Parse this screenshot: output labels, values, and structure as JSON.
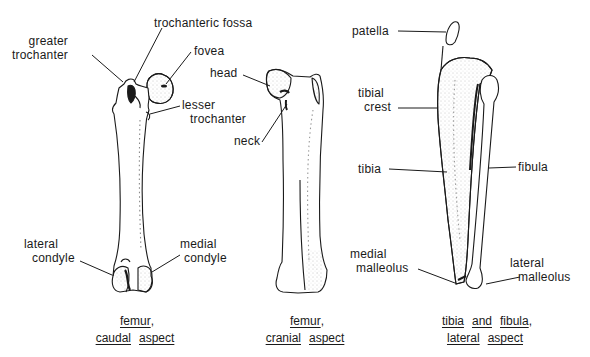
{
  "figure": {
    "colors": {
      "ink": "#1a1a1a",
      "background": "#ffffff",
      "stipple": "#9a9a9a"
    },
    "panels": [
      {
        "id": "femur-caudal",
        "caption": {
          "line1": [
            "femur"
          ],
          "line1_suffix": ",",
          "line2": [
            "caudal",
            "aspect"
          ]
        },
        "labels": {
          "greater_trochanter": [
            "greater",
            "trochanter"
          ],
          "trochanteric_fossa": "trochanteric  fossa",
          "fovea": "fovea",
          "lesser_trochanter": [
            "lesser",
            "trochanter"
          ],
          "lateral_condyle": [
            "lateral",
            "condyle"
          ],
          "medial_condyle": [
            "medial",
            "condyle"
          ]
        }
      },
      {
        "id": "femur-cranial",
        "caption": {
          "line1": [
            "femur"
          ],
          "line1_suffix": ",",
          "line2": [
            "cranial",
            "aspect"
          ]
        },
        "labels": {
          "head": "head",
          "neck": "neck"
        }
      },
      {
        "id": "tibia-fibula-lateral",
        "caption": {
          "line1": [
            "tibia",
            "and",
            "fibula"
          ],
          "line1_suffix": ",",
          "line2": [
            "lateral",
            "aspect"
          ]
        },
        "labels": {
          "patella": "patella",
          "tibial_crest": [
            "tibial",
            "crest"
          ],
          "tibia": "tibia",
          "fibula": "fibula",
          "medial_malleolus": [
            "medial",
            "malleolus"
          ],
          "lateral_malleolus": [
            "lateral",
            "malleolus"
          ]
        }
      }
    ]
  }
}
